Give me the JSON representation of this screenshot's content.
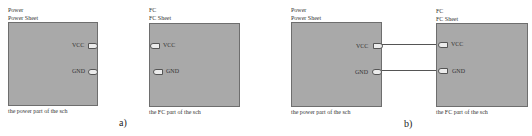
{
  "panels": [
    {
      "caption": "a)",
      "left_sheet": {
        "name": "Power",
        "file": "Power Sheet",
        "description": "the power part of the sch",
        "ports": [
          {
            "label": "VCC",
            "side": "right"
          },
          {
            "label": "GND",
            "side": "right"
          }
        ]
      },
      "right_sheet": {
        "name": "FC",
        "file": "FC Sheet",
        "description": "the FC part of the sch",
        "ports": [
          {
            "label": "VCC",
            "side": "left"
          },
          {
            "label": "GND",
            "side": "left"
          }
        ]
      },
      "connected": false
    },
    {
      "caption": "b)",
      "left_sheet": {
        "name": "Power",
        "file": "Power Sheet",
        "description": "the power part of the sch",
        "ports": [
          {
            "label": "VCC",
            "side": "right"
          },
          {
            "label": "GND",
            "side": "right"
          }
        ]
      },
      "right_sheet": {
        "name": "FC",
        "file": "FC Sheet",
        "description": "the FC part of the sch",
        "ports": [
          {
            "label": "VCC",
            "side": "left"
          },
          {
            "label": "GND",
            "side": "left"
          }
        ]
      },
      "connected": true,
      "wires": [
        {
          "from": "Power.VCC",
          "to": "FC.VCC"
        },
        {
          "from": "Power.GND",
          "to": "FC.GND"
        }
      ]
    }
  ],
  "colors": {
    "sheet_fill": "#a9a9a9",
    "sheet_border": "#6e6e6e",
    "port_fill": "#ececec",
    "wire": "#555555"
  }
}
